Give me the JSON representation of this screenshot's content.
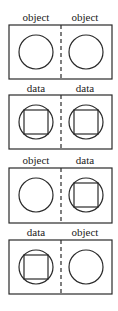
{
  "panels": [
    {
      "left": {
        "label": "object",
        "type": "object"
      },
      "right": {
        "label": "object",
        "type": "object"
      }
    },
    {
      "left": {
        "label": "data",
        "type": "data"
      },
      "right": {
        "label": "data",
        "type": "data"
      }
    },
    {
      "left": {
        "label": "object",
        "type": "object"
      },
      "right": {
        "label": "data",
        "type": "data"
      }
    },
    {
      "left": {
        "label": "data",
        "type": "data"
      },
      "right": {
        "label": "object",
        "type": "object"
      }
    }
  ],
  "legend": {
    "object_icon": "circle",
    "data_icon": "circle-with-inscribed-square",
    "divider": "dashed-vertical-line"
  }
}
